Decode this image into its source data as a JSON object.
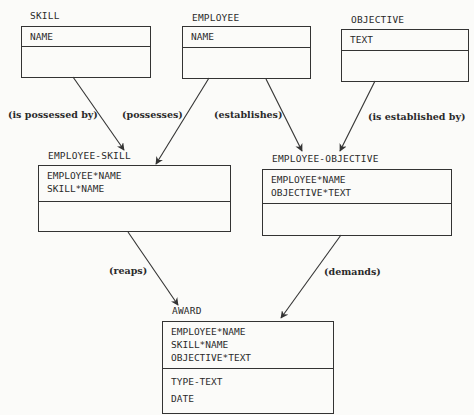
{
  "diagram": {
    "entities": [
      {
        "id": "skill",
        "name": "SKILL",
        "keys": [
          "NAME"
        ],
        "attributes": []
      },
      {
        "id": "employee",
        "name": "EMPLOYEE",
        "keys": [
          "NAME"
        ],
        "attributes": []
      },
      {
        "id": "objective",
        "name": "OBJECTIVE",
        "keys": [
          "TEXT"
        ],
        "attributes": []
      },
      {
        "id": "employee_skill",
        "name": "EMPLOYEE-SKILL",
        "keys": [
          "EMPLOYEE*NAME",
          "SKILL*NAME"
        ],
        "attributes": []
      },
      {
        "id": "employee_objective",
        "name": "EMPLOYEE-OBJECTIVE",
        "keys": [
          "EMPLOYEE*NAME",
          "OBJECTIVE*TEXT"
        ],
        "attributes": []
      },
      {
        "id": "award",
        "name": "AWARD",
        "keys": [
          "EMPLOYEE*NAME",
          "SKILL*NAME",
          "OBJECTIVE*TEXT"
        ],
        "attributes": [
          "TYPE-TEXT",
          "DATE"
        ]
      }
    ],
    "relationships": [
      {
        "from": "SKILL",
        "to": "EMPLOYEE-SKILL",
        "label": "(is possessed by)"
      },
      {
        "from": "EMPLOYEE",
        "to": "EMPLOYEE-SKILL",
        "label": "(possesses)"
      },
      {
        "from": "EMPLOYEE",
        "to": "EMPLOYEE-OBJECTIVE",
        "label": "(establishes)"
      },
      {
        "from": "OBJECTIVE",
        "to": "EMPLOYEE-OBJECTIVE",
        "label": "(is established by)"
      },
      {
        "from": "EMPLOYEE-SKILL",
        "to": "AWARD",
        "label": "(reaps)"
      },
      {
        "from": "EMPLOYEE-OBJECTIVE",
        "to": "AWARD",
        "label": "(demands)"
      }
    ],
    "line_color": "#333333"
  }
}
